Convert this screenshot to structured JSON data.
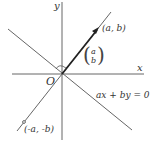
{
  "diagram": {
    "axis_labels": {
      "x": "x",
      "y": "y"
    },
    "origin_label": "O",
    "point_label": "(a, b)",
    "opposite_point_label": "(-a, -b)",
    "vector": {
      "top": "a",
      "bottom": "b"
    },
    "line_equation": "ax + by = 0",
    "colors": {
      "line": "#555555",
      "vector": "#222222",
      "text": "#333333"
    }
  }
}
